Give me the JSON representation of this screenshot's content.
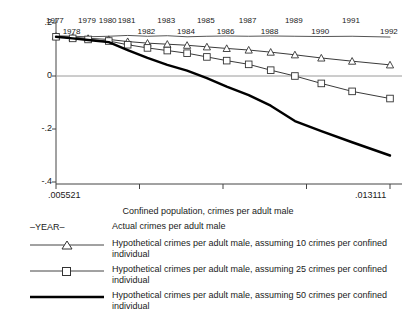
{
  "chart_data": {
    "type": "line",
    "title": "",
    "xlabel": "Confined population, crimes per adult male",
    "ylabel": "",
    "xlim": [
      0.005521,
      0.013111
    ],
    "ylim": [
      -0.45,
      0.22
    ],
    "xticks": [
      "0.005521",
      "",
      "",
      "",
      "0.013111"
    ],
    "xticklabels": [
      ".005521",
      ".013111"
    ],
    "yticks": [
      0.2,
      0.0,
      -0.2,
      -0.4
    ],
    "yticklabels": [
      ".2",
      "0",
      "-.2",
      "-.4"
    ],
    "grid": false,
    "legend_position": "below",
    "point_labels": [
      "1977",
      "1978",
      "1979",
      "1980",
      "1981",
      "1982",
      "1983",
      "1984",
      "1985",
      "1986",
      "1987",
      "1988",
      "1989",
      "1990",
      "1991",
      "1992"
    ],
    "x": [
      0.005521,
      0.0059,
      0.00625,
      0.00672,
      0.00715,
      0.0076,
      0.00805,
      0.0085,
      0.00895,
      0.0094,
      0.0099,
      0.0104,
      0.01095,
      0.01155,
      0.01225,
      0.013111
    ],
    "series": [
      {
        "name": "Actual crimes per adult male",
        "key": "actual",
        "marker": "none",
        "style": "thin",
        "color": "#555555",
        "values": [
          0.152,
          0.15,
          0.148,
          0.15,
          0.153,
          0.15,
          0.152,
          0.148,
          0.15,
          0.151,
          0.15,
          0.151,
          0.15,
          0.149,
          0.15,
          0.147
        ]
      },
      {
        "name": "Hypothetical crimes per adult male, assuming 10 crimes per confined individual",
        "key": "hyp10",
        "marker": "triangle",
        "style": "thin-marker",
        "color": "#3a3a3a",
        "values": [
          0.15,
          0.146,
          0.142,
          0.138,
          0.13,
          0.124,
          0.12,
          0.116,
          0.11,
          0.104,
          0.098,
          0.09,
          0.08,
          0.068,
          0.056,
          0.042
        ]
      },
      {
        "name": "Hypothetical crimes per adult male, assuming 25 crimes per confined individual",
        "key": "hyp25",
        "marker": "square",
        "style": "thin-marker",
        "color": "#3a3a3a",
        "values": [
          0.148,
          0.142,
          0.138,
          0.132,
          0.118,
          0.106,
          0.096,
          0.086,
          0.072,
          0.058,
          0.044,
          0.022,
          0.0,
          -0.028,
          -0.058,
          -0.085
        ]
      },
      {
        "name": "Hypothetical crimes per adult male, assuming 50 crimes per confined individual",
        "key": "hyp50",
        "marker": "none",
        "style": "thick",
        "color": "#000000",
        "values": [
          0.148,
          0.142,
          0.136,
          0.128,
          0.098,
          0.068,
          0.042,
          0.02,
          -0.008,
          -0.04,
          -0.072,
          -0.112,
          -0.17,
          -0.208,
          -0.25,
          -0.3
        ]
      }
    ]
  },
  "year_labels": [
    {
      "text": "1977",
      "row": 0
    },
    {
      "text": "1978",
      "row": 1
    },
    {
      "text": "1979",
      "row": 0
    },
    {
      "text": "1980",
      "row": 0
    },
    {
      "text": "1981",
      "row": 0
    },
    {
      "text": "1982",
      "row": 1
    },
    {
      "text": "1983",
      "row": 0
    },
    {
      "text": "1984",
      "row": 1
    },
    {
      "text": "1985",
      "row": 0
    },
    {
      "text": "1986",
      "row": 1
    },
    {
      "text": "1987",
      "row": 0
    },
    {
      "text": "1988",
      "row": 1
    },
    {
      "text": "1989",
      "row": 0
    },
    {
      "text": "1990",
      "row": 1
    },
    {
      "text": "1991",
      "row": 0
    },
    {
      "text": "1992",
      "row": 1
    }
  ],
  "axis": {
    "x_title": "Confined population, crimes per adult male",
    "x_min_label": ".005521",
    "x_max_label": ".013111",
    "y_labels": [
      ".2",
      "0",
      "-.2",
      "-.4"
    ]
  },
  "legend": {
    "items": [
      {
        "key_type": "year-text",
        "key_label": "–YEAR–",
        "label": "Actual crimes per adult male"
      },
      {
        "key_type": "line-triangle",
        "key_label": "",
        "label": "Hypothetical crimes per adult male, assuming 10 crimes per confined individual"
      },
      {
        "key_type": "line-square",
        "key_label": "",
        "label": "Hypothetical crimes per adult male, assuming 25 crimes per confined individual"
      },
      {
        "key_type": "line-thick",
        "key_label": "",
        "label": "Hypothetical crimes per adult male, assuming 50 crimes per confined individual"
      }
    ]
  }
}
